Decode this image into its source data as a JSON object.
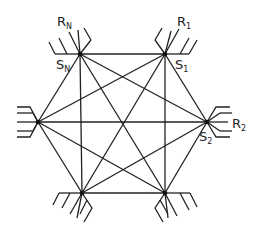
{
  "diagram": {
    "type": "complete-graph-hexagon",
    "nodes": [
      {
        "id": "SN",
        "x": 80,
        "y": 54,
        "station_label": "S",
        "station_sub": "N",
        "receiver_label": "R",
        "receiver_sub": "N"
      },
      {
        "id": "S1",
        "x": 165,
        "y": 54,
        "station_label": "S",
        "station_sub": "1",
        "receiver_label": "R",
        "receiver_sub": "1"
      },
      {
        "id": "S2",
        "x": 207,
        "y": 122,
        "station_label": "S",
        "station_sub": "2",
        "receiver_label": "R",
        "receiver_sub": "2"
      },
      {
        "id": "SB_R",
        "x": 165,
        "y": 193
      },
      {
        "id": "SB_L",
        "x": 82,
        "y": 193
      },
      {
        "id": "SL",
        "x": 38,
        "y": 122
      }
    ],
    "edges": "all-pairs"
  },
  "labels": {
    "rn": {
      "main": "R",
      "sub": "N"
    },
    "sn": {
      "main": "S",
      "sub": "N"
    },
    "r1": {
      "main": "R",
      "sub": "1"
    },
    "s1": {
      "main": "S",
      "sub": "1"
    },
    "r2": {
      "main": "R",
      "sub": "2"
    },
    "s2": {
      "main": "S",
      "sub": "2"
    }
  }
}
